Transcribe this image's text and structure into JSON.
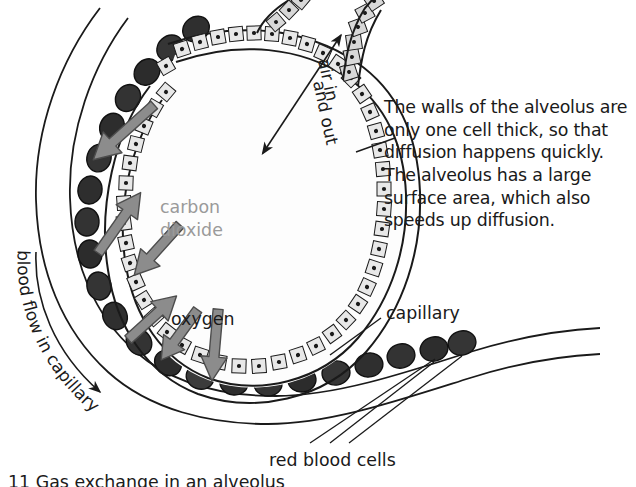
{
  "figure": {
    "title": "Gas exchange in an alveolus",
    "caption": "11 Gas exchange in an alveolus"
  },
  "annotations": {
    "body_text": "The walls of the alveolus are only one cell thick, so that diffusion happens quickly. The alveolus has a large surface area, which also speeds up diffusion.",
    "carbon_dioxide": "carbon\ndioxide",
    "carbon_dioxide_line1": "carbon",
    "carbon_dioxide_line2": "dioxide",
    "oxygen": "oxygen",
    "capillary": "capillary",
    "red_blood_cells": "red blood cells",
    "air_in_and_out_line1": "air in",
    "air_in_and_out_line2": "and out",
    "blood_flow_in_capillary": "blood flow in capillary"
  },
  "colors": {
    "background": "#ffffff",
    "ink": "#1a1a1a",
    "carbon_dioxide_text": "#9a9a9a",
    "arrow_fill": "#8c8c8c",
    "arrow_stroke": "#4d4d4d",
    "red_blood_cell_fill": "#3a3a3a",
    "red_blood_cell_fill_light": "#555555",
    "alveolus_wall_fill": "#e8e8e8",
    "alveolus_lumen": "#fdfdfd",
    "airway_wall_fill": "#d8d8d8"
  },
  "structures": {
    "alveolus": "alveolus-sac",
    "alveolus_wall": "one-cell-thick-epithelium",
    "airway": "bronchiole-airway",
    "capillary": "capillary-vessel",
    "red_blood_cells_count": 22
  },
  "arrows": {
    "carbon_dioxide_direction": "blood-to-alveolus",
    "oxygen_direction": "alveolus-to-blood",
    "air_direction": "bidirectional",
    "blood_flow_direction": "clockwise-along-capillary"
  }
}
